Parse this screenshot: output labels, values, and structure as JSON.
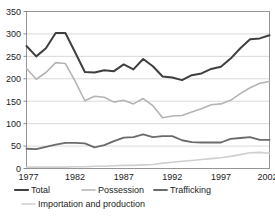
{
  "figure": {
    "clipped_top_text": "",
    "background": "#ffffff"
  },
  "axes": {
    "y_ticks": [
      "0",
      "50",
      "100",
      "150",
      "200",
      "250",
      "300",
      "350"
    ],
    "x_ticks": [
      "1977",
      "1982",
      "1987",
      "1992",
      "1997",
      "2002"
    ]
  },
  "legend": {
    "items": [
      {
        "label": "Total",
        "color": "#3f3f3f"
      },
      {
        "label": "Possession",
        "color": "#b4b4b4"
      },
      {
        "label": "Trafficking",
        "color": "#6b6b6b"
      },
      {
        "label": "Importation and production",
        "color": "#cfcfcf"
      }
    ]
  },
  "chart_data": {
    "type": "line",
    "title": "",
    "xlabel": "",
    "ylabel": "",
    "xlim": [
      1977,
      2002
    ],
    "ylim": [
      0,
      350
    ],
    "y_ticks": [
      0,
      50,
      100,
      150,
      200,
      250,
      300,
      350
    ],
    "x_ticks": [
      1977,
      1982,
      1987,
      1992,
      1997,
      2002
    ],
    "grid": true,
    "legend_position": "bottom",
    "x": [
      1977,
      1978,
      1979,
      1980,
      1981,
      1982,
      1983,
      1984,
      1985,
      1986,
      1987,
      1988,
      1989,
      1990,
      1991,
      1992,
      1993,
      1994,
      1995,
      1996,
      1997,
      1998,
      1999,
      2000,
      2001,
      2002
    ],
    "series": [
      {
        "name": "Total",
        "color": "#3f3f3f",
        "width": 2.0,
        "values": [
          273,
          250,
          268,
          302,
          302,
          259,
          215,
          214,
          219,
          217,
          232,
          221,
          244,
          228,
          205,
          203,
          197,
          208,
          212,
          222,
          227,
          245,
          268,
          288,
          290,
          297
        ]
      },
      {
        "name": "Possession",
        "color": "#b4b4b4",
        "width": 1.6,
        "values": [
          223,
          199,
          214,
          236,
          234,
          195,
          151,
          161,
          159,
          148,
          152,
          144,
          156,
          140,
          113,
          117,
          118,
          126,
          133,
          142,
          144,
          152,
          167,
          180,
          190,
          194
        ]
      },
      {
        "name": "Trafficking",
        "color": "#6b6b6b",
        "width": 1.8,
        "values": [
          44,
          43,
          48,
          53,
          57,
          57,
          56,
          47,
          52,
          61,
          69,
          70,
          76,
          70,
          72,
          72,
          63,
          59,
          58,
          58,
          58,
          66,
          68,
          70,
          64,
          64
        ]
      },
      {
        "name": "Importation and production",
        "color": "#cfcfcf",
        "width": 1.6,
        "values": [
          3,
          3,
          3,
          3,
          3,
          4,
          4,
          5,
          5,
          6,
          7,
          7,
          8,
          9,
          12,
          14,
          16,
          18,
          20,
          22,
          24,
          27,
          31,
          35,
          36,
          34
        ]
      }
    ]
  }
}
